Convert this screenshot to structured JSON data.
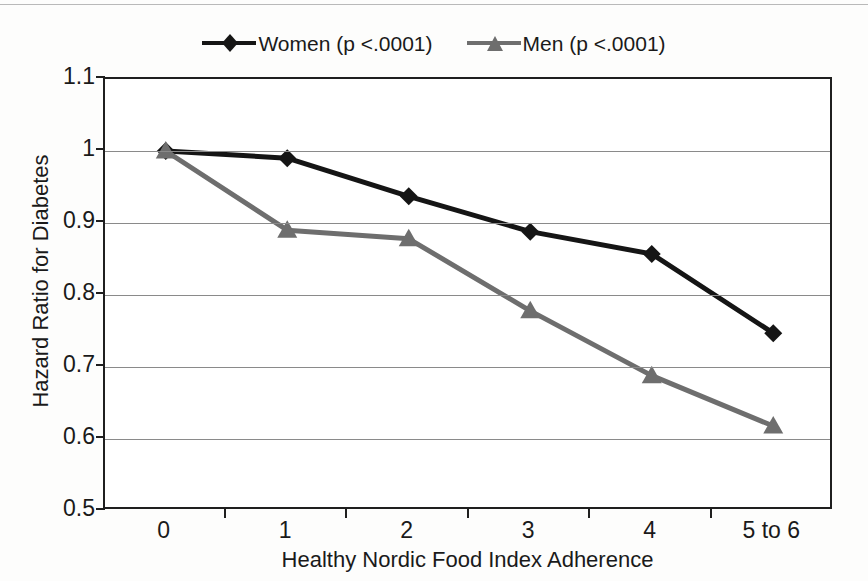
{
  "chart_data": {
    "type": "line",
    "title": "",
    "xlabel": "Healthy Nordic Food Index Adherence",
    "ylabel": "Hazard Ratio for Diabetes",
    "categories": [
      "0",
      "1",
      "2",
      "3",
      "4",
      "5 to 6"
    ],
    "ylim": [
      0.5,
      1.1
    ],
    "yticks": [
      "0.5",
      "0.6",
      "0.7",
      "0.8",
      "0.9",
      "1",
      "1.1"
    ],
    "ytick_values": [
      0.5,
      0.6,
      0.7,
      0.8,
      0.9,
      1.0,
      1.1
    ],
    "grid": true,
    "legend_position": "top-center",
    "series": [
      {
        "name": "Women (p <.0001)",
        "values": [
          1.0,
          0.99,
          0.937,
          0.888,
          0.857,
          0.747
        ],
        "color": "#151515",
        "marker": "diamond"
      },
      {
        "name": "Men (p <.0001)",
        "values": [
          1.0,
          0.89,
          0.878,
          0.778,
          0.688,
          0.618
        ],
        "color": "#6e6e6e",
        "marker": "triangle"
      }
    ]
  },
  "legend": {
    "entries": [
      {
        "label": "Women (p <.0001)",
        "marker": "diamond-marker",
        "color": "#151515"
      },
      {
        "label": "Men (p <.0001)",
        "marker": "triangle-marker",
        "color": "#6e6e6e"
      }
    ]
  },
  "axes": {
    "y_title": "Hazard Ratio for Diabetes",
    "x_title": "Healthy Nordic Food Index Adherence",
    "y_labels": [
      "1.1",
      "1",
      "0.9",
      "0.8",
      "0.7",
      "0.6",
      "0.5"
    ],
    "x_labels": [
      "0",
      "1",
      "2",
      "3",
      "4",
      "5 to 6"
    ]
  }
}
